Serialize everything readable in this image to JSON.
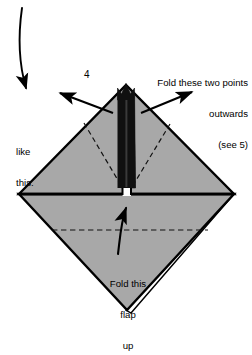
{
  "diagram": {
    "step_number": "4",
    "colors": {
      "paper_fill": "#a8a8a8",
      "shadow_fill": "#101010",
      "outline": "#000000",
      "background": "#ffffff",
      "fold_line": "#1a1a1a"
    },
    "annotations": {
      "fold_points": {
        "line1": "Fold these two points",
        "line2": "outwards",
        "line3": "(see 5)"
      },
      "like_this": {
        "line1": "like",
        "line2": "this."
      },
      "fold_flap": {
        "line1": "Fold this",
        "line2": "flap",
        "line3": "up"
      }
    },
    "shapes": {
      "upper_triangle": "M 19,194 L 126,85 L 234,194 Z",
      "lower_triangle": "M 19,194 L 234,194 L 127,310 Z",
      "center_slit": "M 118,86 L 122,93 L 126,84 L 131,93 L 135,86 L 136,188 L 118,188 Z"
    },
    "fold_lines": {
      "horizontal_midline_y": 194,
      "dashed_horizontal_y": 230,
      "dashed_left_v": "M 84,123 L 122,188",
      "dashed_right_v": "M 170,124 L 132,188"
    },
    "arrows": {
      "curved_entry": {
        "from_x": 22,
        "from_y": 8,
        "to_x": 27,
        "to_y": 95,
        "direction": "down"
      },
      "outward_left": {
        "from_x": 112,
        "from_y": 112,
        "to_x": 56,
        "to_y": 92,
        "direction": "up-left"
      },
      "outward_right": {
        "from_x": 142,
        "from_y": 112,
        "to_x": 196,
        "to_y": 91,
        "direction": "up-right"
      },
      "flap_up": {
        "from_x": 117,
        "from_y": 253,
        "to_x": 126,
        "to_y": 203,
        "direction": "up"
      }
    }
  }
}
